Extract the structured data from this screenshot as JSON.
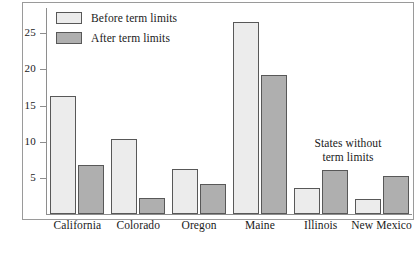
{
  "chart_data": {
    "type": "bar",
    "title": "",
    "subtitle": "",
    "xlabel": "",
    "ylabel": "",
    "ylim": [
      0,
      28.5
    ],
    "yticks": [
      5,
      10,
      15,
      20,
      25
    ],
    "ytick_labels": [
      "5",
      "10",
      "15",
      "20",
      "25"
    ],
    "grid": false,
    "legend_position": "top-left inside plot area",
    "categories": [
      "California",
      "Colorado",
      "Oregon",
      "Maine",
      "Illinois",
      "New Mexico"
    ],
    "series": [
      {
        "name": "Before term limits",
        "color": "#ececec",
        "values": [
          16.3,
          10.4,
          6.2,
          26.6,
          3.6,
          2.1
        ]
      },
      {
        "name": "After term limits",
        "color": "#afafaf",
        "values": [
          6.8,
          2.2,
          4.1,
          19.3,
          6.1,
          5.2
        ]
      }
    ],
    "annotations": [
      {
        "text": "States without term limits",
        "lines": [
          "States without",
          "term limits"
        ],
        "near_categories": [
          "Illinois",
          "New Mexico"
        ]
      }
    ]
  },
  "legend": {
    "items": [
      {
        "label": "Before term limits",
        "swatch": "before"
      },
      {
        "label": "After term limits",
        "swatch": "after"
      }
    ]
  },
  "annotation": {
    "line1": "States without",
    "line2": "term limits"
  },
  "colors": {
    "before_fill": "#ececec",
    "after_fill": "#afafaf",
    "bar_outline": "#585858",
    "axis": "#8e8e8e",
    "frame": "#9a9a9a",
    "text": "#1a1a1a"
  }
}
